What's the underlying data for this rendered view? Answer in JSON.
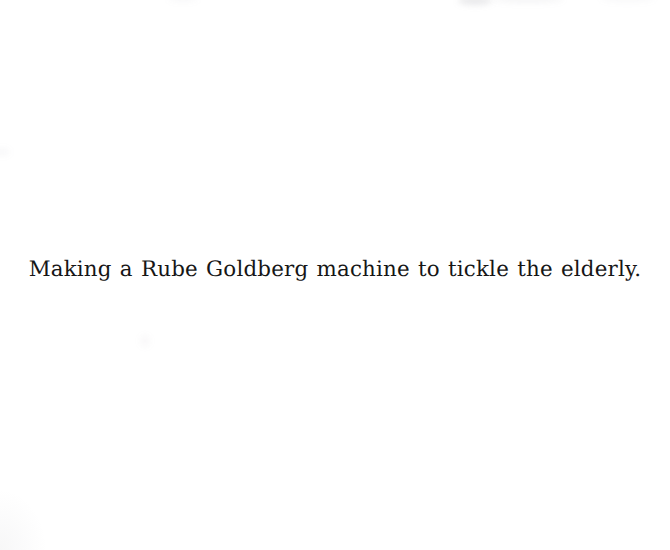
{
  "page": {
    "width": 670,
    "height": 550,
    "background_color": "#ffffff",
    "kind": "scanned-page"
  },
  "caption": {
    "text": "Making a Rube Goldberg machine to tickle the elderly.",
    "color": "#161616",
    "font_size_px": 21.4,
    "style": "slab-serif-typewriter",
    "alignment": "center",
    "baseline_y": 284,
    "left_x": 57,
    "right_x": 655
  },
  "artifacts": {
    "description": "faint gray scan smudges along the top edge and a soft shadow at the bottom-left corner",
    "smudge_color": "#787880",
    "items": [
      {
        "name": "top-smudge-a",
        "x": 458,
        "y": 0,
        "width": 34,
        "height": 6,
        "opacity": 0.16
      },
      {
        "name": "top-smudge-b",
        "x": 492,
        "y": 0,
        "width": 72,
        "height": 5,
        "opacity": 0.07
      },
      {
        "name": "top-smudge-c",
        "x": 168,
        "y": 0,
        "width": 30,
        "height": 4,
        "opacity": 0.05
      },
      {
        "name": "top-smudge-d",
        "x": 600,
        "y": 0,
        "width": 55,
        "height": 4,
        "opacity": 0.05
      },
      {
        "name": "mid-left-speck",
        "x": 0,
        "y": 148,
        "width": 12,
        "height": 8,
        "opacity": 0.05
      },
      {
        "name": "mid-center-speck",
        "x": 140,
        "y": 335,
        "width": 10,
        "height": 12,
        "opacity": 0.05
      },
      {
        "name": "bottom-left-corner-shadow",
        "x": 0,
        "y": 490,
        "width": 46,
        "height": 60,
        "opacity": 0.055
      }
    ]
  }
}
